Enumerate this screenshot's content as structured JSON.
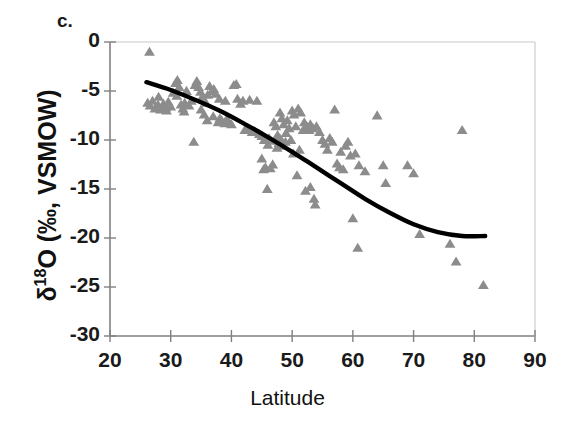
{
  "panel": {
    "label": "c."
  },
  "chart_data": {
    "type": "scatter",
    "title": "",
    "xlabel": "Latitude",
    "ylabel": "δ¹⁸O (‰, VSMOW)",
    "ylabel_base": "O (‰, VSMOW)",
    "ylabel_delta": "δ",
    "ylabel_sup": "18",
    "xlim": [
      20,
      90
    ],
    "ylim": [
      -30,
      0
    ],
    "xticks": [
      20,
      30,
      40,
      50,
      60,
      70,
      80,
      90
    ],
    "yticks": [
      0,
      -5,
      -10,
      -15,
      -20,
      -25,
      -30
    ],
    "xtick_labels": [
      "20",
      "30",
      "40",
      "50",
      "60",
      "70",
      "80",
      "90"
    ],
    "ytick_labels": [
      "0",
      "-5",
      "-10",
      "-15",
      "-20",
      "-25",
      "-30"
    ],
    "grid": false,
    "legend": null,
    "marker": "triangle",
    "marker_color": "#8c8c8c",
    "axis_color": "#808080",
    "trend_color": "#000000",
    "series": [
      {
        "name": "δ¹⁸O observations",
        "marker": "triangle",
        "color": "#8c8c8c",
        "points": [
          [
            26.5,
            -1.0
          ],
          [
            26.2,
            -6.2
          ],
          [
            26.6,
            -6.5
          ],
          [
            27.0,
            -6.0
          ],
          [
            27.4,
            -6.8
          ],
          [
            27.9,
            -6.4
          ],
          [
            28.3,
            -6.9
          ],
          [
            28.0,
            -5.6
          ],
          [
            28.8,
            -6.3
          ],
          [
            29.2,
            -6.7
          ],
          [
            29.6,
            -6.1
          ],
          [
            29.3,
            -7.0
          ],
          [
            30.0,
            -6.6
          ],
          [
            30.4,
            -5.2
          ],
          [
            30.8,
            -4.2
          ],
          [
            31.1,
            -3.9
          ],
          [
            31.4,
            -4.6
          ],
          [
            31.0,
            -5.5
          ],
          [
            31.7,
            -6.4
          ],
          [
            32.0,
            -6.8
          ],
          [
            32.3,
            -6.2
          ],
          [
            32.6,
            -5.0
          ],
          [
            32.2,
            -7.1
          ],
          [
            33.0,
            -6.5
          ],
          [
            33.4,
            -6.0
          ],
          [
            33.8,
            -10.2
          ],
          [
            34.0,
            -4.4
          ],
          [
            34.3,
            -4.0
          ],
          [
            34.6,
            -4.6
          ],
          [
            34.9,
            -5.1
          ],
          [
            35.2,
            -5.6
          ],
          [
            35.0,
            -6.9
          ],
          [
            35.5,
            -7.4
          ],
          [
            35.8,
            -6.2
          ],
          [
            36.1,
            -5.4
          ],
          [
            36.4,
            -4.5
          ],
          [
            36.0,
            -8.0
          ],
          [
            36.8,
            -5.0
          ],
          [
            37.1,
            -4.8
          ],
          [
            37.4,
            -5.3
          ],
          [
            37.0,
            -7.6
          ],
          [
            37.8,
            -8.2
          ],
          [
            38.1,
            -7.8
          ],
          [
            38.4,
            -8.0
          ],
          [
            38.0,
            -5.8
          ],
          [
            38.9,
            -8.3
          ],
          [
            39.2,
            -7.9
          ],
          [
            39.5,
            -8.1
          ],
          [
            39.0,
            -6.0
          ],
          [
            40.0,
            -8.4
          ],
          [
            40.4,
            -4.4
          ],
          [
            40.8,
            -4.3
          ],
          [
            41.0,
            -5.8
          ],
          [
            41.5,
            -6.3
          ],
          [
            41.9,
            -6.0
          ],
          [
            42.2,
            -9.0
          ],
          [
            42.6,
            -8.9
          ],
          [
            43.0,
            -5.9
          ],
          [
            43.4,
            -9.2
          ],
          [
            43.8,
            -9.1
          ],
          [
            44.2,
            -6.0
          ],
          [
            44.6,
            -9.4
          ],
          [
            45.0,
            -9.6
          ],
          [
            45.4,
            -10.0
          ],
          [
            45.0,
            -11.9
          ],
          [
            45.6,
            -12.8
          ],
          [
            45.3,
            -13.0
          ],
          [
            45.9,
            -15.0
          ],
          [
            46.2,
            -9.8
          ],
          [
            46.5,
            -10.1
          ],
          [
            46.0,
            -10.5
          ],
          [
            46.8,
            -12.5
          ],
          [
            46.4,
            -12.9
          ],
          [
            47.0,
            -8.2
          ],
          [
            47.3,
            -8.6
          ],
          [
            47.6,
            -9.5
          ],
          [
            47.2,
            -10.0
          ],
          [
            47.8,
            -10.3
          ],
          [
            47.5,
            -10.8
          ],
          [
            48.0,
            -7.2
          ],
          [
            48.3,
            -7.8
          ],
          [
            48.6,
            -8.4
          ],
          [
            48.1,
            -9.9
          ],
          [
            48.9,
            -10.2
          ],
          [
            48.5,
            -10.6
          ],
          [
            49.2,
            -8.0
          ],
          [
            49.5,
            -8.8
          ],
          [
            49.0,
            -9.3
          ],
          [
            49.8,
            -10.0
          ],
          [
            50.0,
            -7.0
          ],
          [
            50.3,
            -7.4
          ],
          [
            50.6,
            -8.6
          ],
          [
            50.2,
            -11.4
          ],
          [
            50.8,
            -13.6
          ],
          [
            51.0,
            -6.8
          ],
          [
            51.4,
            -7.2
          ],
          [
            51.8,
            -9.0
          ],
          [
            51.2,
            -11.0
          ],
          [
            52.0,
            -8.2
          ],
          [
            52.4,
            -8.6
          ],
          [
            52.8,
            -9.0
          ],
          [
            52.2,
            -15.2
          ],
          [
            53.0,
            -8.4
          ],
          [
            53.4,
            -8.8
          ],
          [
            53.0,
            -14.8
          ],
          [
            53.6,
            -16.0
          ],
          [
            53.8,
            -16.6
          ],
          [
            54.0,
            -8.6
          ],
          [
            54.5,
            -9.2
          ],
          [
            55.0,
            -10.0
          ],
          [
            55.4,
            -10.4
          ],
          [
            55.8,
            -11.0
          ],
          [
            56.2,
            -9.8
          ],
          [
            56.6,
            -10.2
          ],
          [
            57.0,
            -6.9
          ],
          [
            57.4,
            -12.4
          ],
          [
            57.8,
            -12.8
          ],
          [
            58.0,
            -11.2
          ],
          [
            58.4,
            -13.0
          ],
          [
            58.8,
            -10.6
          ],
          [
            59.2,
            -10.2
          ],
          [
            59.6,
            -11.6
          ],
          [
            60.0,
            -18.0
          ],
          [
            60.4,
            -11.4
          ],
          [
            60.8,
            -21.0
          ],
          [
            61.0,
            -12.6
          ],
          [
            62.0,
            -13.2
          ],
          [
            64.0,
            -7.5
          ],
          [
            65.0,
            -12.6
          ],
          [
            65.4,
            -14.4
          ],
          [
            69.0,
            -12.6
          ],
          [
            70.0,
            -13.4
          ],
          [
            71.0,
            -19.6
          ],
          [
            76.0,
            -20.6
          ],
          [
            77.0,
            -22.4
          ],
          [
            78.0,
            -9.0
          ],
          [
            81.5,
            -24.8
          ]
        ]
      }
    ],
    "trend_line": {
      "name": "fitted trend",
      "color": "#000000",
      "points": [
        [
          26.0,
          -4.1
        ],
        [
          30.0,
          -4.9
        ],
        [
          34.0,
          -5.9
        ],
        [
          38.0,
          -7.0
        ],
        [
          42.0,
          -8.3
        ],
        [
          46.0,
          -9.7
        ],
        [
          50.0,
          -11.2
        ],
        [
          54.0,
          -12.8
        ],
        [
          58.0,
          -14.4
        ],
        [
          62.0,
          -16.0
        ],
        [
          66.0,
          -17.4
        ],
        [
          70.0,
          -18.6
        ],
        [
          74.0,
          -19.4
        ],
        [
          78.0,
          -19.8
        ],
        [
          81.8,
          -19.8
        ]
      ]
    }
  }
}
